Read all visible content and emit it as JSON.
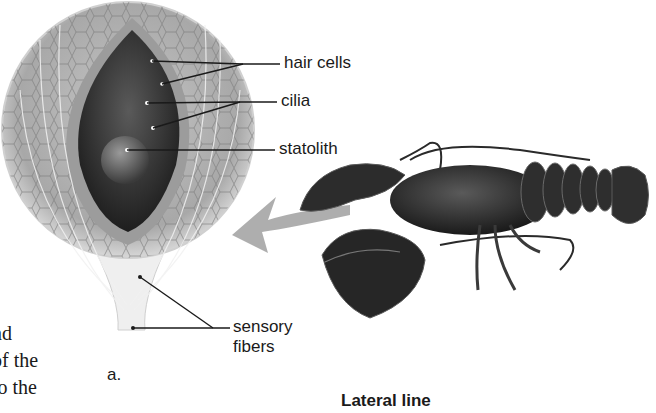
{
  "figure": {
    "panel_label": "a.",
    "labels": {
      "hair_cells": "hair cells",
      "cilia": "cilia",
      "statolith": "statolith",
      "sensory_fibers_line1": "sensory",
      "sensory_fibers_line2": "fibers"
    },
    "next_section_caption": "Lateral line"
  },
  "body_text_fragments": [
    "nd",
    "of the",
    "to the"
  ],
  "colors": {
    "text": "#1a1a1a",
    "arrow": "#9a9a9a",
    "statocyst_outer": "#b8b8b8",
    "statocyst_inner": "#3a3a3a",
    "lobster": "#2b2b2b"
  }
}
